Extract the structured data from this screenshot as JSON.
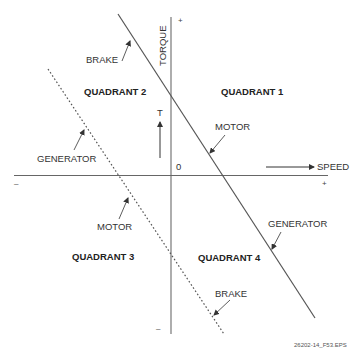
{
  "axes": {
    "vertical_label": "TORQUE",
    "horizontal_label": "SPEED",
    "origin_label": "0",
    "torque_symbol": "T",
    "vertical_positive": "+",
    "vertical_negative": "–",
    "horizontal_positive": "+",
    "horizontal_negative": "–"
  },
  "quadrants": [
    {
      "label": "QUADRANT 1"
    },
    {
      "label": "QUADRANT 2"
    },
    {
      "label": "QUADRANT 3"
    },
    {
      "label": "QUADRANT 4"
    }
  ],
  "solid_line_labels": {
    "quadrant2": "BRAKE",
    "quadrant1": "MOTOR",
    "quadrant4": "GENERATOR"
  },
  "dashed_line_labels": {
    "quadrant2": "GENERATOR",
    "quadrant3": "MOTOR",
    "quadrant4": "BRAKE"
  },
  "caption": "26202-14_F53.EPS",
  "colors": {
    "line": "#555555",
    "text": "#333333",
    "background": "#ffffff"
  }
}
